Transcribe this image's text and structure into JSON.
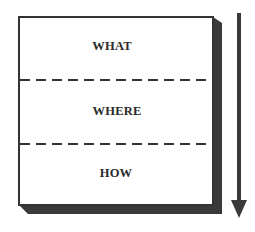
{
  "diagram": {
    "type": "stacked-layers-with-direction-arrow",
    "layers": [
      {
        "label": "WHAT"
      },
      {
        "label": "WHERE"
      },
      {
        "label": "HOW"
      }
    ],
    "separator_style": "dashed",
    "arrow": {
      "direction": "down"
    },
    "colors": {
      "background": "#ffffff",
      "box_fill": "#ffffff",
      "box_border": "#333333",
      "shadow": "#3a3a3a",
      "arrow": "#3a3a3a",
      "text": "#2a2a2a"
    }
  }
}
